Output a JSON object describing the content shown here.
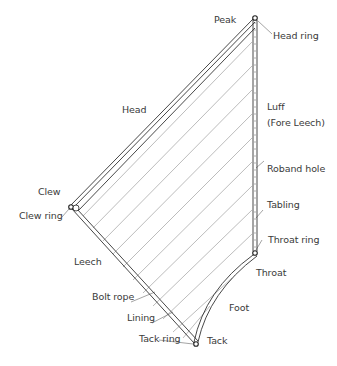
{
  "diagram": {
    "type": "sail-parts",
    "line_color": "#333333",
    "hatch_color": "#8a8a8a",
    "background": "#ffffff",
    "points": {
      "peak": [
        255,
        18
      ],
      "clew": [
        72,
        207
      ],
      "throat": [
        255,
        253
      ],
      "tack": [
        196,
        344
      ]
    },
    "labels": {
      "peak": "Peak",
      "head_ring": "Head ring",
      "head": "Head",
      "luff": "Luff",
      "luff_alt": "(Fore Leech)",
      "roband_hole": "Roband hole",
      "tabling": "Tabling",
      "throat_ring": "Throat ring",
      "throat": "Throat",
      "clew": "Clew",
      "clew_ring": "Clew ring",
      "leech": "Leech",
      "bolt_rope": "Bolt rope",
      "foot": "Foot",
      "lining": "Lining",
      "tack_ring": "Tack ring",
      "tack": "Tack"
    }
  }
}
